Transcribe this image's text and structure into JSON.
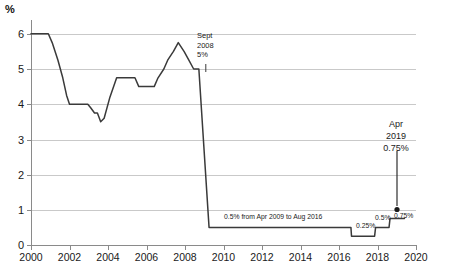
{
  "chart_data": {
    "type": "line",
    "title": "",
    "subtitle": "",
    "xlabel": "",
    "ylabel": "%",
    "y_unit_label": "%",
    "xlim": [
      2000,
      2020
    ],
    "ylim": [
      0,
      6.4
    ],
    "grid": true,
    "legend": "none",
    "y_ticks": [
      "6",
      "5",
      "4",
      "3",
      "2",
      "1",
      "0"
    ],
    "y_tick_values": [
      6,
      5,
      4,
      3,
      2,
      1,
      0
    ],
    "x_ticks": [
      "2000",
      "2002",
      "2004",
      "2006",
      "2008",
      "2010",
      "2012",
      "2014",
      "2016",
      "2018",
      "2020"
    ],
    "x_tick_values": [
      2000,
      2002,
      2004,
      2006,
      2008,
      2010,
      2012,
      2014,
      2016,
      2018,
      2020
    ],
    "series": [
      {
        "name": "Bank Rate",
        "color": "#3a3a3a",
        "x": [
          2000.0,
          2000.9,
          2001.1,
          2001.4,
          2001.65,
          2001.85,
          2002.0,
          2002.95,
          2003.1,
          2003.3,
          2003.45,
          2003.62,
          2003.8,
          2004.1,
          2004.45,
          2004.75,
          2005.4,
          2005.6,
          2006.4,
          2006.6,
          2006.9,
          2007.1,
          2007.4,
          2007.65,
          2007.95,
          2008.2,
          2008.45,
          2008.72,
          2009.25,
          2016.62,
          2016.65,
          2017.85,
          2017.9,
          2018.6,
          2018.65,
          2019.4
        ],
        "y": [
          6.0,
          6.0,
          5.75,
          5.25,
          4.75,
          4.25,
          4.0,
          4.0,
          3.9,
          3.75,
          3.75,
          3.5,
          3.6,
          4.2,
          4.75,
          4.75,
          4.75,
          4.5,
          4.5,
          4.75,
          5.0,
          5.25,
          5.5,
          5.75,
          5.5,
          5.25,
          5.0,
          5.0,
          0.5,
          0.5,
          0.25,
          0.25,
          0.5,
          0.5,
          0.75,
          0.75
        ]
      }
    ],
    "annotations": [
      {
        "id": "sept-2008",
        "lines": [
          "Sept",
          "2008",
          "5%"
        ],
        "value": 5.0,
        "date": "Sept 2008"
      },
      {
        "id": "apr-2019",
        "lines": [
          "Apr",
          "2019",
          "0.75%"
        ],
        "value": 0.75,
        "date": "Apr 2019"
      },
      {
        "id": "half-percent-range",
        "text": "0.5% from Apr 2009 to Aug 2016",
        "value": 0.5
      },
      {
        "id": "rate-025",
        "text": "0.25%",
        "value": 0.25
      },
      {
        "id": "rate-05",
        "text": "0.5%",
        "value": 0.5
      },
      {
        "id": "rate-075",
        "text": "0.75%",
        "value": 0.75
      }
    ],
    "marker": {
      "id": "apr-2019-dot",
      "x": 2019.4,
      "y": 0.75,
      "shape": "circle",
      "color": "#1a1a1a"
    }
  },
  "annotation_text": {
    "sept_line1": "Sept",
    "sept_line2": "2008",
    "sept_line3": "5%",
    "apr_line1": "Apr",
    "apr_line2": "2019",
    "apr_line3": "0.75%",
    "range_note": "0.5% from Apr 2009 to Aug 2016",
    "rate_025": "0.25%",
    "rate_05": "0.5%",
    "rate_075": "0.75%"
  },
  "colors": {
    "line": "#3a3a3a",
    "grid": "#c9c9c9",
    "axis": "#8a8a8a",
    "text": "#1a1a1a",
    "background": "#ffffff"
  }
}
